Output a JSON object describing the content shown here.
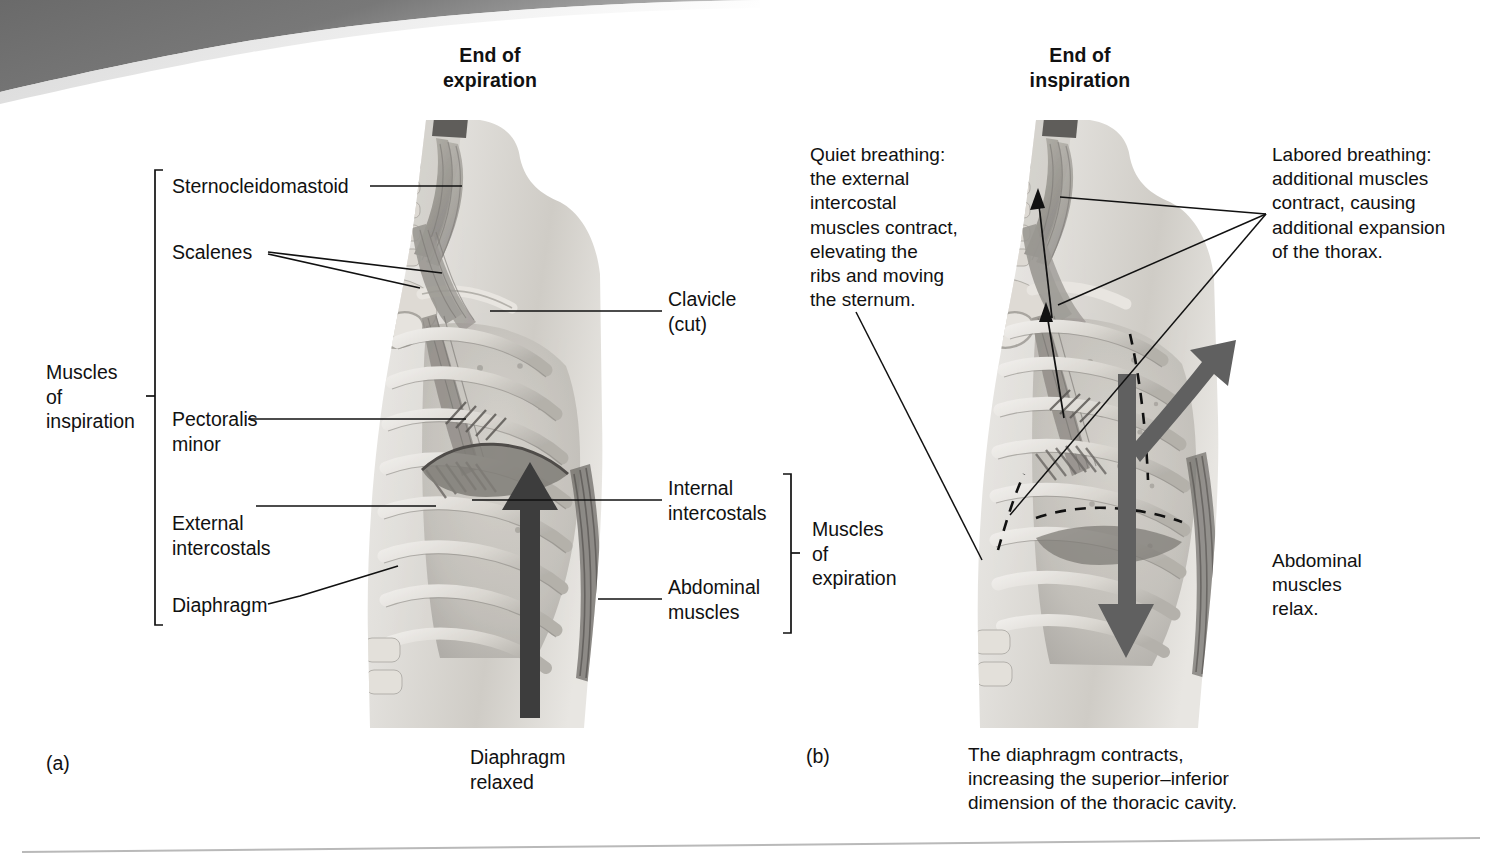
{
  "figure": {
    "panel_a_letter": "(a)",
    "panel_b_letter": "(b)",
    "panel_a_title": "End of\nexpiration",
    "panel_b_title": "End of\ninspiration"
  },
  "panel_a": {
    "bracket_inspiration": "Muscles\nof\ninspiration",
    "bracket_expiration": "Muscles\nof\nexpiration",
    "labels_left": [
      {
        "id": "sternocleidomastoid",
        "text": "Sternocleidomastoid"
      },
      {
        "id": "scalenes",
        "text": "Scalenes"
      },
      {
        "id": "pectoralis-minor",
        "text": "Pectoralis\nminor"
      },
      {
        "id": "external-intercostals",
        "text": "External\nintercostals"
      },
      {
        "id": "diaphragm",
        "text": "Diaphragm"
      }
    ],
    "labels_right": [
      {
        "id": "clavicle",
        "text": "Clavicle\n(cut)"
      },
      {
        "id": "internal-intercostals",
        "text": "Internal\nintercostals"
      },
      {
        "id": "abdominal-muscles",
        "text": "Abdominal\nmuscles"
      }
    ],
    "caption": "Diaphragm\nrelaxed"
  },
  "panel_b": {
    "quiet_breathing": "Quiet breathing:\nthe external\nintercostal\nmuscles contract,\nelevating the\nribs and moving\nthe sternum.",
    "labored_breathing": "Labored breathing:\nadditional muscles\ncontract, causing\nadditional expansion\nof the thorax.",
    "abdominal_relax": "Abdominal\nmuscles\nrelax.",
    "caption": "The diaphragm contracts,\nincreasing the superior–inferior\ndimension of the thoracic cavity."
  },
  "colors": {
    "ink": "#111111",
    "banner_dark": "#6e6e6e",
    "arrow_dark": "#3d3d3d",
    "arrow_gray": "#606060",
    "rib_light": "#d8d5cf",
    "tissue": "#bdbab4",
    "footer_rule": "#b9b9b9"
  }
}
